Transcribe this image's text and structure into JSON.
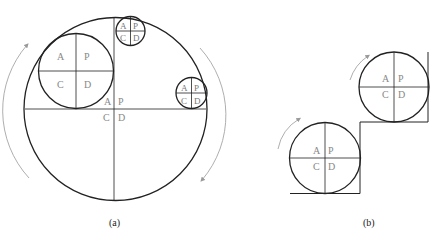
{
  "figure": {
    "panels": [
      {
        "caption": "(a)",
        "center_quadrant": {
          "tl": "A",
          "tr": "P",
          "bl": "C",
          "br": "D"
        },
        "large_wheel": {
          "tl": "A",
          "tr": "P",
          "bl": "C",
          "br": "D"
        },
        "top_wheel": {
          "tl": "A",
          "tr": "P",
          "bl": "C",
          "br": "D"
        },
        "right_wheel": {
          "tl": "A",
          "tr": "P",
          "bl": "C",
          "br": "D"
        }
      },
      {
        "caption": "(b)",
        "lower_wheel": {
          "tl": "A",
          "tr": "P",
          "bl": "C",
          "br": "D"
        },
        "upper_wheel": {
          "tl": "A",
          "tr": "P",
          "bl": "C",
          "br": "D"
        }
      }
    ]
  },
  "colors": {
    "stroke": "#222222",
    "arrow": "#999999",
    "label": "#777777"
  }
}
